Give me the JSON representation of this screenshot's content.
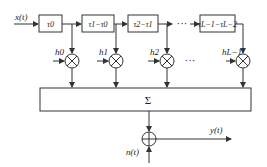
{
  "diagram": {
    "type": "tapped-delay-line channel model",
    "input_label": "x(t)",
    "output_label": "y(t)",
    "noise_label": "n(t)",
    "sum_symbol": "Σ",
    "adder_symbol": "+",
    "ellipsis_delay": "···",
    "ellipsis_taps": "···",
    "delay_boxes": [
      {
        "label": "τ0"
      },
      {
        "label": "τ1−τ0"
      },
      {
        "label": "τ2−τ1"
      },
      {
        "label": "τL−1−τL−2"
      }
    ],
    "taps": [
      {
        "label": "h0"
      },
      {
        "label": "h1"
      },
      {
        "label": "h2"
      },
      {
        "label": "hL−1"
      }
    ],
    "colors": {
      "stroke": "#333333",
      "background": "#ffffff"
    }
  }
}
